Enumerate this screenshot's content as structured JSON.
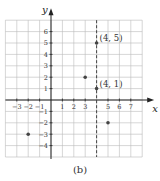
{
  "figure": {
    "caption": "(b)",
    "x_axis_label": "x",
    "y_axis_label": "y",
    "x_ticks": [
      "−3",
      "−2",
      "−1",
      "1",
      "2",
      "3",
      "5",
      "6",
      "7"
    ],
    "y_ticks": [
      "6",
      "5",
      "4",
      "3",
      "2",
      "1",
      "−1",
      "−2",
      "−3",
      "−4"
    ],
    "point_labels": [
      "(4, 5)",
      "(4, 1)"
    ],
    "dashed_line": "x = 4"
  },
  "chart_data": {
    "type": "scatter",
    "title": "",
    "caption": "(b)",
    "xlabel": "x",
    "ylabel": "y",
    "xlim": [
      -4,
      8
    ],
    "ylim": [
      -5,
      7
    ],
    "grid": true,
    "x_tick_labels": [
      -3,
      -2,
      -1,
      1,
      2,
      3,
      5,
      6,
      7
    ],
    "y_tick_labels": [
      -4,
      -3,
      -2,
      -1,
      1,
      2,
      3,
      4,
      5,
      6
    ],
    "points": [
      {
        "x": 4,
        "y": 5,
        "label": "(4, 5)"
      },
      {
        "x": 4,
        "y": 1,
        "label": "(4, 1)"
      },
      {
        "x": 3,
        "y": 2
      },
      {
        "x": 5,
        "y": -2
      },
      {
        "x": -2,
        "y": -3
      }
    ],
    "annotations": [
      {
        "type": "vertical-dashed-line",
        "x": 4
      }
    ]
  }
}
